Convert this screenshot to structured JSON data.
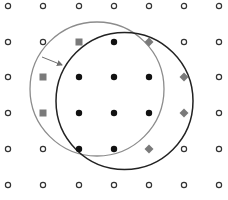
{
  "diagram": {
    "width": 228,
    "height": 200,
    "grid": {
      "cols_x": [
        8,
        43,
        79,
        114,
        149,
        184,
        219
      ],
      "rows_y": [
        6,
        42,
        77,
        113,
        149,
        185
      ]
    },
    "colors": {
      "open_point": "#333333",
      "filled_point": "#111111",
      "square": "#7a7a7a",
      "diamond": "#7a7a7a",
      "gray_circle": "#8c8c8c",
      "black_circle": "#222222",
      "arrow": "#6e6e6e"
    },
    "circles": [
      {
        "name": "old-neighborhood-circle",
        "cx": 97,
        "cy": 89,
        "r": 67,
        "color_key": "gray_circle",
        "width": 1.3
      },
      {
        "name": "new-neighborhood-circle",
        "cx": 124.5,
        "cy": 101,
        "r": 68.5,
        "color_key": "black_circle",
        "width": 1.5
      }
    ],
    "arrow": {
      "x1": 42,
      "y1": 57,
      "x2": 62,
      "y2": 65
    },
    "points": [
      [
        "o",
        "o",
        "o",
        "o",
        "o",
        "o",
        "o"
      ],
      [
        "o",
        "o",
        "s",
        "f",
        "d",
        "o",
        "o"
      ],
      [
        "o",
        "s",
        "f",
        "f",
        "f",
        "d",
        "o"
      ],
      [
        "o",
        "s",
        "f",
        "f",
        "f",
        "d",
        "o"
      ],
      [
        "o",
        "o",
        "f",
        "f",
        "d",
        "o",
        "o"
      ],
      [
        "o",
        "o",
        "o",
        "o",
        "o",
        "o",
        "o"
      ]
    ],
    "legend_of_point_codes": {
      "o": "open-circle",
      "f": "filled-circle",
      "s": "gray-square",
      "d": "gray-diamond"
    }
  }
}
